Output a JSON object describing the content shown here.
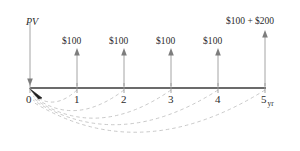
{
  "diagram": {
    "title_label": "PV",
    "axis": {
      "unit_label": "yr",
      "tick_labels": [
        "0",
        "1",
        "2",
        "3",
        "4",
        "5"
      ],
      "tick_x": [
        30,
        77,
        124,
        171,
        218,
        265
      ],
      "baseline_y": 88,
      "line_color": "#3a3a3a"
    },
    "pv_arrow": {
      "label": "PV",
      "direction": "down",
      "x": 30,
      "top_y": 22,
      "bottom_y": 86,
      "color": "#9a9a9a"
    },
    "cash_flows": [
      {
        "period": "1",
        "label": "$100",
        "x": 77,
        "arrow_top_y": 48,
        "arrow_bottom_y": 86
      },
      {
        "period": "2",
        "label": "$100",
        "x": 124,
        "arrow_top_y": 48,
        "arrow_bottom_y": 86
      },
      {
        "period": "3",
        "label": "$100",
        "x": 171,
        "arrow_top_y": 48,
        "arrow_bottom_y": 86
      },
      {
        "period": "4",
        "label": "$100",
        "x": 218,
        "arrow_top_y": 48,
        "arrow_bottom_y": 86
      },
      {
        "period": "5",
        "label": "$100 + $200",
        "x": 265,
        "arrow_top_y": 30,
        "arrow_bottom_y": 86
      }
    ],
    "discount_arcs": [
      {
        "from_period": "1",
        "from_x": 77,
        "to_x": 30,
        "depth_y": 104
      },
      {
        "from_period": "2",
        "from_x": 124,
        "to_x": 30,
        "depth_y": 115
      },
      {
        "from_period": "3",
        "from_x": 171,
        "to_x": 30,
        "depth_y": 126
      },
      {
        "from_period": "4",
        "from_x": 218,
        "to_x": 30,
        "depth_y": 136
      },
      {
        "from_period": "5",
        "from_x": 265,
        "to_x": 30,
        "depth_y": 147
      }
    ],
    "colors": {
      "arc": "#c3c3c3",
      "arrow": "#9a9a9a",
      "timeline": "#3a3a3a",
      "text": "#2b2b2b"
    }
  }
}
